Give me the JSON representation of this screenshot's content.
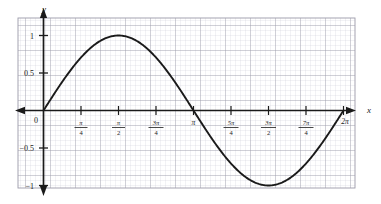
{
  "figure": {
    "kind": "coordinate-graph",
    "background": "#ffffff",
    "grid_paper_color": "#c9c9d6",
    "grid_major_color": "#9a9aa8",
    "curve_color": "#1a1a1a",
    "axis_color": "#1a1a1a"
  },
  "axes": {
    "x_label": "x",
    "y_label": "y",
    "origin_label": "0"
  },
  "x_ticks": [
    {
      "label": "0",
      "type": "plain",
      "value": 0
    },
    {
      "label": "π/4",
      "type": "fraction",
      "numerator": "π",
      "denominator": "4",
      "value": 0.7853981634
    },
    {
      "label": "π/2",
      "type": "fraction",
      "numerator": "π",
      "denominator": "2",
      "value": 1.5707963268
    },
    {
      "label": "3π/4",
      "type": "fraction",
      "numerator": "3π",
      "denominator": "4",
      "value": 2.3561944902
    },
    {
      "label": "π",
      "type": "plain-pi",
      "value": 3.1415926536
    },
    {
      "label": "5π/4",
      "type": "fraction",
      "numerator": "5π",
      "denominator": "4",
      "value": 3.926990817
    },
    {
      "label": "3π/2",
      "type": "fraction",
      "numerator": "3π",
      "denominator": "2",
      "value": 4.7123889804
    },
    {
      "label": "7π/4",
      "type": "fraction",
      "numerator": "7π",
      "denominator": "4",
      "value": 5.4977871438
    },
    {
      "label": "2π",
      "type": "plain-pi",
      "value": 6.2831853072
    }
  ],
  "y_ticks": [
    {
      "label": "1",
      "value": 1
    },
    {
      "label": "0.5",
      "value": 0.5
    },
    {
      "label": "−0.5",
      "value": -0.5
    },
    {
      "label": "−1",
      "value": -1
    }
  ],
  "chart_data": {
    "type": "line",
    "title": "",
    "xlabel": "x",
    "ylabel": "y",
    "grid": true,
    "legend": "none",
    "xlim": [
      0,
      6.2831853072
    ],
    "ylim": [
      -1,
      1
    ],
    "xtick_labels": [
      "0",
      "π/4",
      "π/2",
      "3π/4",
      "π",
      "5π/4",
      "3π/2",
      "7π/4",
      "2π"
    ],
    "xtick_values": [
      0,
      0.7853981634,
      1.5707963268,
      2.3561944902,
      3.1415926536,
      3.926990817,
      4.7123889804,
      5.4977871438,
      6.2831853072
    ],
    "ytick_labels": [
      "−1",
      "−0.5",
      "0",
      "0.5",
      "1"
    ],
    "ytick_values": [
      -1,
      -0.5,
      0,
      0.5,
      1
    ],
    "series": [
      {
        "name": "y = sin x",
        "function": "sin",
        "x": [
          0,
          0.3926990817,
          0.7853981634,
          1.1780972451,
          1.5707963268,
          1.9634954085,
          2.3561944902,
          2.7488935719,
          3.1415926536,
          3.5342917353,
          3.926990817,
          4.3196898987,
          4.7123889804,
          5.1050880621,
          5.4977871438,
          5.8904862255,
          6.2831853072
        ],
        "values": [
          0,
          0.3827,
          0.7071,
          0.9239,
          1,
          0.9239,
          0.7071,
          0.3827,
          0,
          -0.3827,
          -0.7071,
          -0.9239,
          -1,
          -0.9239,
          -0.7071,
          -0.3827,
          0
        ]
      }
    ],
    "annotations": {
      "maximum": {
        "x": "π/2",
        "y": 1
      },
      "minimum": {
        "x": "3π/2",
        "y": -1
      },
      "zeros": [
        "0",
        "π",
        "2π"
      ]
    }
  }
}
